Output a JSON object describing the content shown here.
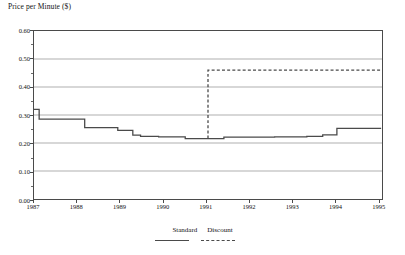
{
  "chart_data": {
    "type": "line",
    "title": "Price per Minute ($)",
    "xlabel": "",
    "ylabel": "Price per Minute ($)",
    "ylim": [
      0.0,
      0.6
    ],
    "xlim": [
      1987.0,
      1995.1
    ],
    "grid": true,
    "legend_position": "bottom-center",
    "y_ticks": [
      "0.00",
      "0.10",
      "0.20",
      "0.30",
      "0.40",
      "0.50",
      "0.60"
    ],
    "y_tick_values": [
      0.0,
      0.1,
      0.2,
      0.3,
      0.4,
      0.5,
      0.6
    ],
    "x_ticks": [
      "1987",
      "1988",
      "1989",
      "1990",
      "1991",
      "1992",
      "1993",
      "1994",
      "1995"
    ],
    "x_tick_values": [
      1987,
      1988,
      1989,
      1990,
      1991,
      1992,
      1993,
      1994,
      1995
    ],
    "series": [
      {
        "name": "Standard",
        "style": "solid",
        "color": "#4a4a4a",
        "step": "post",
        "x": [
          1987.0,
          1987.12,
          1988.18,
          1988.95,
          1989.3,
          1989.48,
          1989.9,
          1990.52,
          1991.1,
          1991.42,
          1991.95,
          1992.6,
          1993.35,
          1993.72,
          1994.05,
          1995.08
        ],
        "values": [
          0.32,
          0.285,
          0.255,
          0.245,
          0.228,
          0.224,
          0.222,
          0.216,
          0.216,
          0.221,
          0.221,
          0.222,
          0.224,
          0.229,
          0.252,
          0.252
        ]
      },
      {
        "name": "Discount",
        "style": "dashed",
        "color": "#4a4a4a",
        "step": "post",
        "x": [
          1991.05,
          1991.05,
          1995.08
        ],
        "values": [
          0.216,
          0.46,
          0.46
        ]
      }
    ],
    "legend": [
      "Standard",
      "Discount"
    ]
  }
}
